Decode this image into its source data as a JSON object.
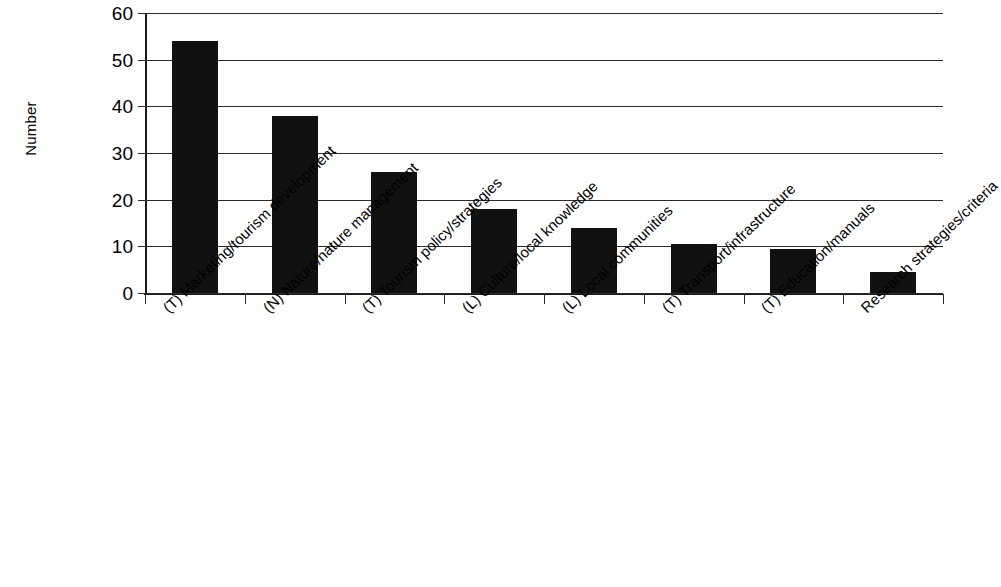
{
  "chart_data": {
    "type": "bar",
    "title": "",
    "subtitle": "",
    "xlabel": "",
    "ylabel": "Number",
    "ylim": [
      0,
      60
    ],
    "yticks": [
      0,
      10,
      20,
      30,
      40,
      50,
      60
    ],
    "ytick_labels": [
      "0",
      "10",
      "20",
      "30",
      "40",
      "50",
      "60"
    ],
    "grid": true,
    "legend": false,
    "legend_position": "none",
    "bar_color": "#111111",
    "axis_color": "#1a1a1a",
    "categories": [
      "(T) Marketing/tourism development",
      "(N) Nature/nature management",
      "(T) Tourism policy/strategies",
      "(L) Culture/local knowledge",
      "(L) Local communities",
      "(T) Transport/infrastructure",
      "(T) Education/manuals",
      "Research strategies/criteria"
    ],
    "values": [
      54,
      38,
      26,
      18,
      14,
      10.5,
      9.5,
      4.5
    ],
    "annotations": []
  }
}
